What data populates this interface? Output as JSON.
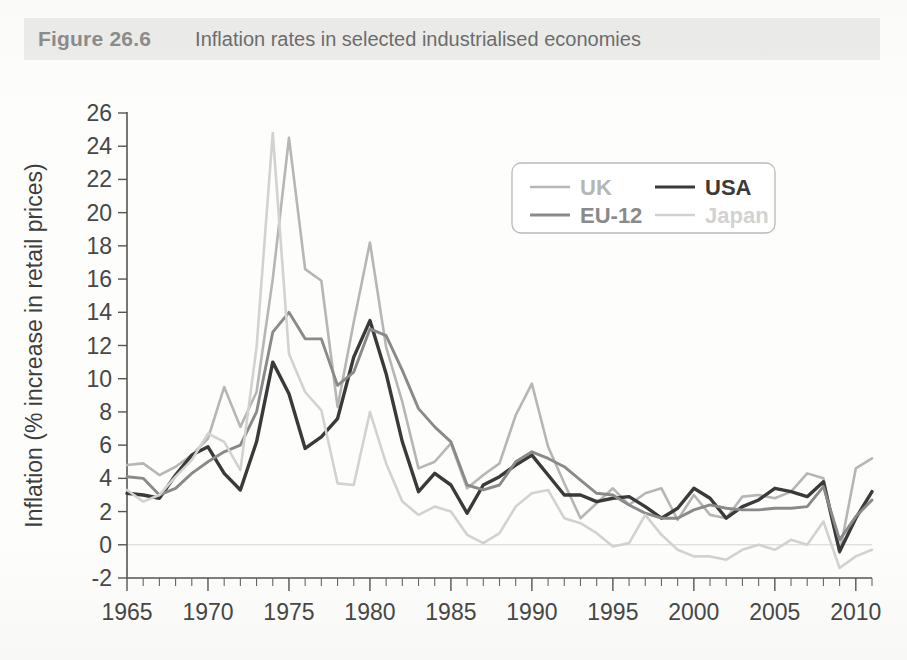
{
  "header": {
    "figure_number": "Figure 26.6",
    "caption": "Inflation rates in selected industrialised economies",
    "bar_color": "#ececea",
    "number_color": "#8c8c8c",
    "caption_color": "#6d6d6d"
  },
  "legend": {
    "position": "upper-right-inside",
    "entries": [
      {
        "label": "UK",
        "color": "#b6b6b6",
        "width": 2.6,
        "bold": true
      },
      {
        "label": "USA",
        "color": "#3a3a3a",
        "width": 3.2,
        "bold": true
      },
      {
        "label": "EU-12",
        "color": "#8a8a8a",
        "width": 2.8,
        "bold": true
      },
      {
        "label": "Japan",
        "color": "#d2d2d2",
        "width": 2.6,
        "bold": true
      }
    ]
  },
  "chart_data": {
    "type": "line",
    "title": "Inflation rates in selected industrialised economies",
    "xlabel": "",
    "ylabel": "Inflation (% increase in retail prices)",
    "xlim": [
      1965,
      2011
    ],
    "ylim": [
      -2,
      26
    ],
    "ytick_step": 2,
    "yticks": [
      -2,
      0,
      2,
      4,
      6,
      8,
      10,
      12,
      14,
      16,
      18,
      20,
      22,
      24,
      26
    ],
    "xticks_major": [
      1965,
      1970,
      1975,
      1980,
      1985,
      1990,
      1995,
      2000,
      2005,
      2010
    ],
    "xticks_minor_step": 1,
    "grid": false,
    "zero_line": true,
    "legend_position": "upper right",
    "x": [
      1965,
      1966,
      1967,
      1968,
      1969,
      1970,
      1971,
      1972,
      1973,
      1974,
      1975,
      1976,
      1977,
      1978,
      1979,
      1980,
      1981,
      1982,
      1983,
      1984,
      1985,
      1986,
      1987,
      1988,
      1989,
      1990,
      1991,
      1992,
      1993,
      1994,
      1995,
      1996,
      1997,
      1998,
      1999,
      2000,
      2001,
      2002,
      2003,
      2004,
      2005,
      2006,
      2007,
      2008,
      2009,
      2010,
      2011
    ],
    "series": [
      {
        "name": "UK",
        "color": "#b6b6b6",
        "values": [
          4.8,
          4.9,
          4.2,
          4.7,
          5.4,
          6.4,
          9.5,
          7.1,
          9.2,
          16.0,
          24.5,
          16.6,
          15.9,
          8.3,
          13.4,
          18.2,
          11.9,
          8.6,
          4.6,
          5.0,
          6.1,
          3.4,
          4.2,
          4.9,
          7.8,
          9.7,
          5.9,
          3.7,
          1.6,
          2.5,
          3.4,
          2.4,
          3.1,
          3.4,
          1.5,
          3.0,
          1.8,
          1.6,
          2.9,
          3.0,
          2.8,
          3.2,
          4.3,
          4.0,
          -0.5,
          4.6,
          5.2
        ],
        "note": "light grey, sharp 1975 peak at 24.5 and 1980 peak at 18.2"
      },
      {
        "name": "USA",
        "color": "#3a3a3a",
        "values": [
          3.1,
          3.0,
          2.8,
          4.2,
          5.4,
          5.9,
          4.3,
          3.3,
          6.2,
          11.0,
          9.1,
          5.8,
          6.5,
          7.6,
          11.3,
          13.5,
          10.3,
          6.2,
          3.2,
          4.3,
          3.6,
          1.9,
          3.6,
          4.1,
          4.8,
          5.4,
          4.2,
          3.0,
          3.0,
          2.6,
          2.8,
          2.9,
          2.3,
          1.6,
          2.2,
          3.4,
          2.8,
          1.6,
          2.3,
          2.7,
          3.4,
          3.2,
          2.9,
          3.8,
          -0.4,
          1.6,
          3.2
        ],
        "note": "darkest line, thickest; 1980 peak 13.5, 2009 trough -0.4"
      },
      {
        "name": "EU-12",
        "color": "#8a8a8a",
        "values": [
          4.1,
          4.0,
          3.0,
          3.4,
          4.3,
          5.0,
          5.6,
          6.0,
          8.0,
          12.8,
          14.0,
          12.4,
          12.4,
          9.6,
          10.4,
          13.0,
          12.6,
          10.5,
          8.2,
          7.1,
          6.2,
          3.6,
          3.3,
          3.6,
          5.0,
          5.6,
          5.2,
          4.7,
          3.9,
          3.1,
          3.0,
          2.4,
          1.9,
          1.6,
          1.6,
          2.1,
          2.4,
          2.2,
          2.1,
          2.1,
          2.2,
          2.2,
          2.3,
          3.5,
          0.3,
          1.7,
          2.7
        ],
        "note": "mid grey; 1975 peak 14.0, 1980 peak 13.0"
      },
      {
        "name": "Japan",
        "color": "#d2d2d2",
        "values": [
          3.3,
          2.6,
          3.0,
          4.1,
          5.1,
          6.7,
          6.2,
          4.5,
          11.9,
          24.8,
          11.5,
          9.2,
          8.1,
          3.7,
          3.6,
          8.0,
          4.9,
          2.6,
          1.8,
          2.3,
          2.0,
          0.6,
          0.1,
          0.7,
          2.3,
          3.1,
          3.3,
          1.6,
          1.3,
          0.7,
          -0.1,
          0.1,
          1.8,
          0.6,
          -0.3,
          -0.7,
          -0.7,
          -0.9,
          -0.3,
          0.0,
          -0.3,
          0.3,
          0.0,
          1.4,
          -1.4,
          -0.7,
          -0.3
        ],
        "note": "lightest grey; 1974 peak 24.8, deflation after 1999"
      }
    ]
  },
  "axes": {
    "ylabel": "Inflation (% increase in retail prices)",
    "ytick_labels": [
      "-2",
      "0",
      "2",
      "4",
      "6",
      "8",
      "10",
      "12",
      "14",
      "16",
      "18",
      "20",
      "22",
      "24",
      "26"
    ],
    "xtick_labels": [
      "1965",
      "1970",
      "1975",
      "1980",
      "1985",
      "1990",
      "1995",
      "2000",
      "2005",
      "2010"
    ]
  }
}
